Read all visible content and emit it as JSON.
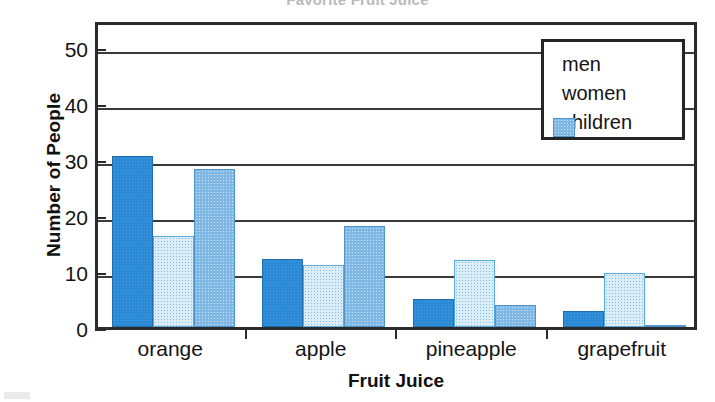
{
  "chart_data": {
    "type": "bar",
    "title": "Favorite Fruit Juice",
    "xlabel": "Fruit Juice",
    "ylabel": "Number of People",
    "categories": [
      "orange",
      "apple",
      "pineapple",
      "grapefruit"
    ],
    "series": [
      {
        "name": "men",
        "color": "#2b8ad5",
        "values": [
          30.5,
          12.2,
          5.0,
          2.9
        ]
      },
      {
        "name": "women",
        "color": "#daedf9",
        "values": [
          16.3,
          11.1,
          12.0,
          9.7
        ]
      },
      {
        "name": "children",
        "color": "#7fb8e4",
        "values": [
          28.3,
          18.1,
          4.0,
          0.3
        ]
      }
    ],
    "ylim": [
      0,
      55
    ],
    "yticks": [
      0,
      10,
      20,
      30,
      40,
      50
    ],
    "ytick_labels": [
      "0",
      "10",
      "20",
      "30",
      "40",
      "50"
    ],
    "grid": true,
    "grid_axis": "y",
    "legend_position": "upper right",
    "legend_entries": [
      "men",
      "women",
      "children"
    ]
  },
  "axis": {
    "y_title": "Number of People",
    "x_title": "Fruit Juice"
  },
  "legend": {
    "items": [
      {
        "label": "men"
      },
      {
        "label": "women"
      },
      {
        "label": "children"
      }
    ]
  }
}
